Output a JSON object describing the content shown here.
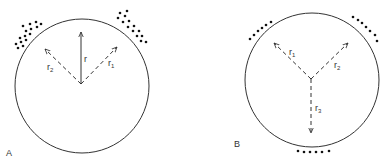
{
  "figure": {
    "panels": [
      {
        "id": "A",
        "label": "A",
        "vectors": [
          {
            "name": "r",
            "label": "r",
            "sub": "",
            "style": "solid"
          },
          {
            "name": "r1",
            "label": "r",
            "sub": "1",
            "style": "dashed"
          },
          {
            "name": "r2",
            "label": "r",
            "sub": "2",
            "style": "dashed"
          }
        ]
      },
      {
        "id": "B",
        "label": "B",
        "vectors": [
          {
            "name": "r1",
            "label": "r",
            "sub": "1",
            "style": "dashed"
          },
          {
            "name": "r2",
            "label": "r",
            "sub": "2",
            "style": "dashed"
          },
          {
            "name": "r3",
            "label": "r",
            "sub": "3",
            "style": "dashed"
          }
        ]
      }
    ],
    "colors": {
      "stroke": "#333333",
      "dots": "#111111",
      "background": "#ffffff"
    }
  }
}
